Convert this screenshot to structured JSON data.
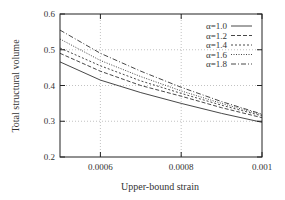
{
  "chart_data": {
    "type": "line",
    "title": "",
    "xlabel": "Upper-bound strain",
    "ylabel": "Total structural volume",
    "xlim": [
      0.0005,
      0.001
    ],
    "ylim": [
      0.2,
      0.6
    ],
    "xticks": [
      0.0006,
      0.0008,
      0.001
    ],
    "xtick_labels": [
      "0.0006",
      "0.0008",
      "0.001"
    ],
    "yticks": [
      0.2,
      0.3,
      0.4,
      0.5,
      0.6
    ],
    "ytick_labels": [
      "0.2",
      "0.3",
      "0.4",
      "0.5",
      "0.6"
    ],
    "grid": true,
    "legend_position": "upper right",
    "x": [
      0.0005,
      0.0006,
      0.0007,
      0.0008,
      0.0009,
      0.001
    ],
    "series": [
      {
        "name": "α=1.0",
        "dash": "",
        "values": [
          0.466,
          0.415,
          0.38,
          0.35,
          0.322,
          0.297
        ]
      },
      {
        "name": "α=1.2",
        "dash": "4,2",
        "values": [
          0.49,
          0.44,
          0.4,
          0.37,
          0.338,
          0.31
        ]
      },
      {
        "name": "α=1.4",
        "dash": "2,2",
        "values": [
          0.505,
          0.455,
          0.413,
          0.378,
          0.345,
          0.315
        ]
      },
      {
        "name": "α=1.6",
        "dash": "1,1.5",
        "values": [
          0.53,
          0.47,
          0.425,
          0.385,
          0.35,
          0.318
        ]
      },
      {
        "name": "α=1.8",
        "dash": "5,2,1,2",
        "values": [
          0.555,
          0.49,
          0.44,
          0.395,
          0.355,
          0.32
        ]
      }
    ]
  }
}
